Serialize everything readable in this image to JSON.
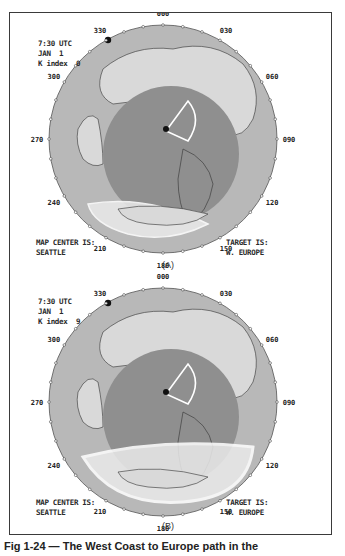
{
  "colors": {
    "outer_ring": "#b8b8b8",
    "land": "#d9d9d9",
    "night_disc": "#8f8f8f",
    "aurora": "#eaeaea",
    "path": "#ffffff",
    "sun_dot": "#111111"
  },
  "panels": [
    {
      "id": "A",
      "time": "7:30 UTC",
      "date": "JAN  1",
      "k_index_label": "K index",
      "k_index_value": "0",
      "map_center_label": "MAP CENTER IS:",
      "map_center_value": "SEATTLE",
      "target_label": "TARGET IS:",
      "target_value": "W. EUROPE",
      "panel_label": "(A)",
      "auroral_oval_extent": "narrow"
    },
    {
      "id": "B",
      "time": "7:30 UTC",
      "date": "JAN  1",
      "k_index_label": "K index",
      "k_index_value": "9",
      "map_center_label": "MAP CENTER IS:",
      "map_center_value": "SEATTLE",
      "target_label": "TARGET IS:",
      "target_value": "W. EUROPE",
      "panel_label": "(B)",
      "auroral_oval_extent": "wide"
    }
  ],
  "bearing_labels": [
    "000",
    "030",
    "060",
    "090",
    "120",
    "150",
    "180",
    "210",
    "240",
    "270",
    "300",
    "330"
  ],
  "caption": "Fig 1-24 — The West Coast to Europe path in the"
}
